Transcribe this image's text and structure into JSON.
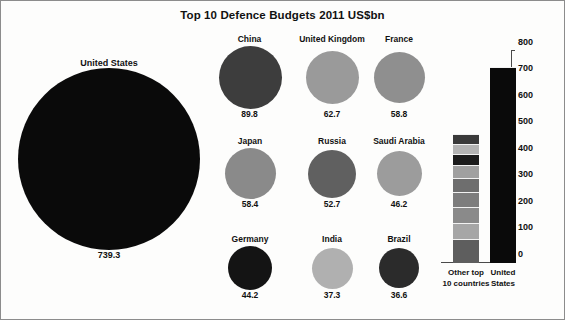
{
  "title": "Top 10 Defence Budgets 2011 US$bn",
  "bar_panel": {
    "columns": [
      {
        "caption_line1": "Other top",
        "caption_line2": "10 countries"
      },
      {
        "caption_line1": "United",
        "caption_line2": "States"
      }
    ],
    "axis_ticks": [
      "800",
      "700",
      "600",
      "500",
      "400",
      "300",
      "200",
      "100",
      "0"
    ]
  },
  "chart_data": {
    "type": "bar",
    "title": "Top 10 Defence Budgets 2011 US$bn",
    "xlabel": "",
    "ylabel": "US$bn",
    "ylim": [
      0,
      800
    ],
    "ytick_step": 100,
    "grid": false,
    "legend": "none",
    "units": "US$bn",
    "year": 2011,
    "categories": [
      "United States",
      "China",
      "United Kingdom",
      "France",
      "Japan",
      "Russia",
      "Saudi Arabia",
      "Germany",
      "India",
      "Brazil"
    ],
    "values": [
      739.3,
      89.8,
      62.7,
      58.8,
      58.4,
      52.7,
      46.2,
      44.2,
      37.3,
      36.6
    ],
    "bubbles": [
      {
        "label": "United States",
        "value": 739.3,
        "value_text": "739.3",
        "color": "#0a0a0a",
        "diameter": 182
      },
      {
        "label": "China",
        "value": 89.8,
        "value_text": "89.8",
        "color": "#3d3d3d",
        "diameter": 63
      },
      {
        "label": "United Kingdom",
        "value": 62.7,
        "value_text": "62.7",
        "color": "#9a9a9a",
        "diameter": 53
      },
      {
        "label": "France",
        "value": 58.8,
        "value_text": "58.8",
        "color": "#8f8f8f",
        "diameter": 51
      },
      {
        "label": "Japan",
        "value": 58.4,
        "value_text": "58.4",
        "color": "#8a8a8a",
        "diameter": 51
      },
      {
        "label": "Russia",
        "value": 52.7,
        "value_text": "52.7",
        "color": "#606060",
        "diameter": 48
      },
      {
        "label": "Saudi Arabia",
        "value": 46.2,
        "value_text": "46.2",
        "color": "#9c9c9c",
        "diameter": 45
      },
      {
        "label": "Germany",
        "value": 44.2,
        "value_text": "44.2",
        "color": "#141414",
        "diameter": 44
      },
      {
        "label": "India",
        "value": 37.3,
        "value_text": "37.3",
        "color": "#b0b0b0",
        "diameter": 41
      },
      {
        "label": "Brazil",
        "value": 36.6,
        "value_text": "36.6",
        "color": "#2b2b2b",
        "diameter": 40
      }
    ],
    "comparison_bars": {
      "type": "stacked_bar",
      "bars": [
        {
          "name": "Other top 10 countries",
          "total": 486.7,
          "segments": [
            {
              "label": "China",
              "value": 89.8,
              "color": "#5e5e5e"
            },
            {
              "label": "United Kingdom",
              "value": 62.7,
              "color": "#a6a6a6"
            },
            {
              "label": "France",
              "value": 58.8,
              "color": "#8a8a8a"
            },
            {
              "label": "Japan",
              "value": 58.4,
              "color": "#7d7d7d"
            },
            {
              "label": "Russia",
              "value": 52.7,
              "color": "#6e6e6e"
            },
            {
              "label": "Saudi Arabia",
              "value": 46.2,
              "color": "#a0a0a0"
            },
            {
              "label": "Germany",
              "value": 44.2,
              "color": "#1c1c1c"
            },
            {
              "label": "India",
              "value": 37.3,
              "color": "#b4b4b4"
            },
            {
              "label": "Brazil",
              "value": 36.6,
              "color": "#3a3a3a"
            }
          ]
        },
        {
          "name": "United States",
          "total": 739.3,
          "segments": [
            {
              "label": "United States",
              "value": 739.3,
              "color": "#0a0a0a"
            }
          ]
        }
      ]
    }
  }
}
